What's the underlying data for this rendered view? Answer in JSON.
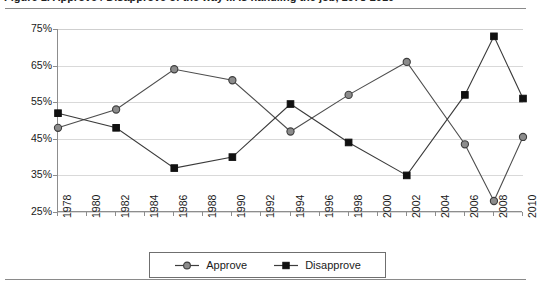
{
  "figure": {
    "title_cropped": "Figure 1.  Approve / Disapprove of the way ... is handling the job, 1978-2010",
    "has_top_rule": true,
    "has_bottom_rule": true
  },
  "chart_data": {
    "type": "line",
    "title": "",
    "xlabel": "",
    "ylabel": "",
    "ylim": [
      25,
      75
    ],
    "ytick_labels": [
      "75%",
      "65%",
      "55%",
      "45%",
      "35%",
      "25%"
    ],
    "ytick_values": [
      75,
      65,
      55,
      45,
      35,
      25
    ],
    "grid": true,
    "grid_axis": "y",
    "legend_position": "bottom-center",
    "categories": [
      "1978",
      "1980",
      "1982",
      "1984",
      "1986",
      "1988",
      "1990",
      "1992",
      "1994",
      "1996",
      "1998",
      "2000",
      "2002",
      "2004",
      "2006",
      "2008",
      "2010"
    ],
    "x_tick_labels": [
      "1978",
      "1980",
      "1982",
      "1984",
      "1986",
      "1988",
      "1990",
      "1992",
      "1994",
      "1996",
      "1998",
      "2000",
      "2002",
      "2004",
      "2006",
      "2008",
      "2010"
    ],
    "data_years": [
      1978,
      1982,
      1986,
      1990,
      1994,
      1998,
      2002,
      2006,
      2008,
      2010
    ],
    "series": [
      {
        "name": "Approve",
        "marker": "circle",
        "color": "#8c8c8c",
        "x": [
          1978,
          1982,
          1986,
          1990,
          1994,
          1998,
          2002,
          2006,
          2008,
          2010
        ],
        "values": [
          48,
          53,
          64,
          61,
          47,
          57,
          66,
          43.5,
          28,
          45.5
        ]
      },
      {
        "name": "Disapprove",
        "marker": "square",
        "color": "#111111",
        "x": [
          1978,
          1982,
          1986,
          1990,
          1994,
          1998,
          2002,
          2006,
          2008,
          2010
        ],
        "values": [
          52,
          48,
          37,
          40,
          54.5,
          44,
          35,
          57,
          73,
          56
        ]
      }
    ]
  },
  "legend": {
    "items": [
      {
        "label": "Approve",
        "marker": "circle",
        "color": "#8c8c8c"
      },
      {
        "label": "Disapprove",
        "marker": "square",
        "color": "#111111"
      }
    ]
  }
}
